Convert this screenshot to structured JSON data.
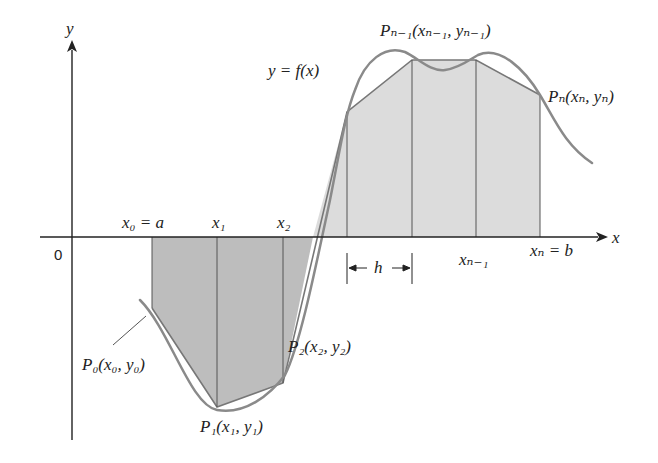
{
  "diagram": {
    "colors": {
      "curve": "#8a8a8a",
      "fill_dark": "#bdbdbd",
      "fill_light": "#dcdcdc",
      "axis": "#222222",
      "grid_lines": "#555555"
    },
    "axes": {
      "x_label": "x",
      "y_label": "y",
      "origin_label": "0"
    },
    "curve_label": "y = f(x)",
    "partition_labels": {
      "x0": "x₀ = a",
      "x1": "x₁",
      "x2": "x₂",
      "xn_minus_1": "xₙ₋₁",
      "xn": "xₙ = b"
    },
    "point_labels": {
      "P0": "P₀(x₀, y₀)",
      "P1": "P₁(x₁, y₁)",
      "P2": "P₂(x₂, y₂)",
      "Pn_minus_1": "Pₙ₋₁(xₙ₋₁, yₙ₋₁)",
      "Pn": "Pₙ(xₙ, yₙ)"
    },
    "width_label": "h",
    "partition_points": [
      {
        "x": 152,
        "y": 308
      },
      {
        "x": 217,
        "y": 407
      },
      {
        "x": 283,
        "y": 383
      },
      {
        "x": 347,
        "y": 112
      },
      {
        "x": 412,
        "y": 60
      },
      {
        "x": 476,
        "y": 60
      },
      {
        "x": 540,
        "y": 95
      }
    ]
  }
}
